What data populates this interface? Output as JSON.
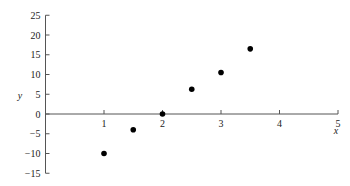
{
  "chart_data": {
    "type": "scatter",
    "title": "",
    "xlabel": "x",
    "ylabel": "y",
    "xlim": [
      0,
      5
    ],
    "ylim": [
      -15,
      25
    ],
    "grid": false,
    "legend": null,
    "x_ticks": [
      1,
      2,
      3,
      4,
      5
    ],
    "y_ticks": [
      -15,
      -10,
      -5,
      0,
      5,
      10,
      15,
      20,
      25
    ],
    "series": [
      {
        "name": "data",
        "marker": "filled-circle",
        "color": "#000000",
        "points": [
          {
            "x": 1.0,
            "y": -10
          },
          {
            "x": 1.5,
            "y": -4
          },
          {
            "x": 2.0,
            "y": 0
          },
          {
            "x": 2.5,
            "y": 6.25
          },
          {
            "x": 3.0,
            "y": 10.5
          },
          {
            "x": 3.5,
            "y": 16.5
          }
        ]
      }
    ]
  }
}
